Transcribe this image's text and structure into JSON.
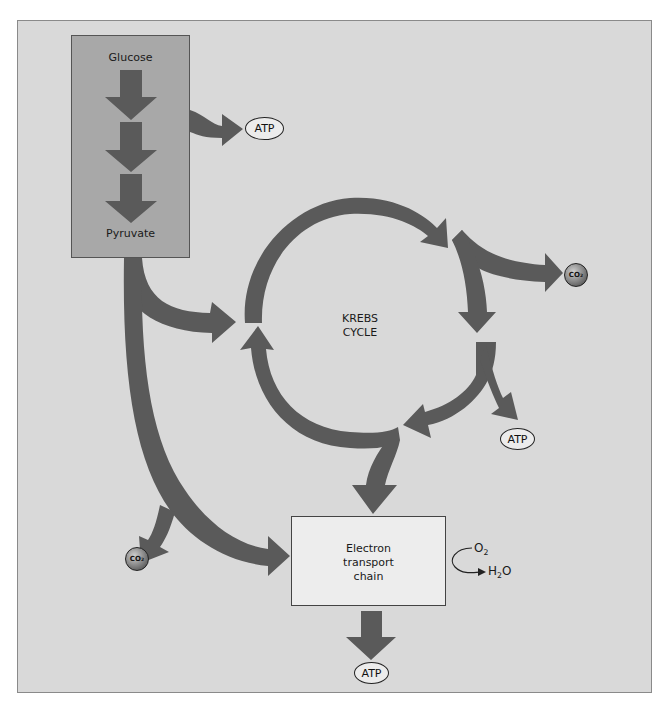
{
  "colors": {
    "background": "#d9d9d9",
    "glycolysis_box": "#a8a8a8",
    "arrow": "#5a5a5a",
    "etc_box": "#ededed",
    "oval": "#ececec"
  },
  "glycolysis": {
    "start_label": "Glucose",
    "end_label": "Pyruvate",
    "output": "ATP"
  },
  "krebs": {
    "title_line1": "KREBS",
    "title_line2": "CYCLE",
    "outputs": [
      "CO2",
      "ATP"
    ]
  },
  "etc": {
    "line1": "Electron",
    "line2": "transport",
    "line3": "chain",
    "input": "O",
    "input_sub": "2",
    "product_prefix": "H",
    "product_sub": "2",
    "product_suffix": "O",
    "output": "ATP"
  },
  "co2_label": {
    "main": "CO",
    "sub": "2"
  },
  "pyruvate_branch_output": "CO2"
}
